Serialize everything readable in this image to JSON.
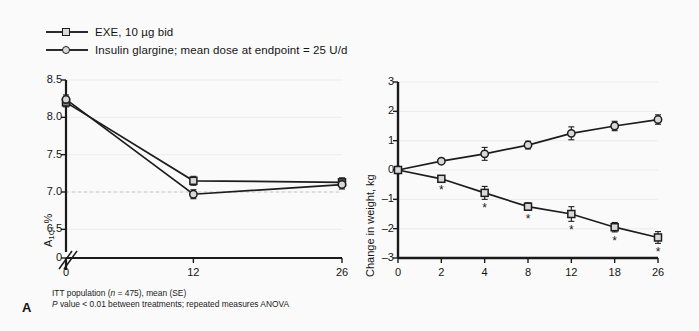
{
  "panel": {
    "label": "A"
  },
  "legend": {
    "items": [
      {
        "marker": "square-marker-icon",
        "label": "EXE, 10 µg bid"
      },
      {
        "marker": "circle-marker-icon",
        "label": "Insulin glargine; mean dose at endpoint = 25 U/d"
      }
    ]
  },
  "footnotes": [
    "ITT population (n = 475), mean (SE)",
    "P value < 0.01 between treatments; repeated measures ANOVA"
  ],
  "chart_data": [
    {
      "id": "a1c",
      "type": "line",
      "title": "",
      "xlabel": "Time, wk",
      "ylabel": "A1C, %",
      "x": [
        0,
        12,
        26
      ],
      "xticklabels": [
        "0",
        "12",
        "26"
      ],
      "yticklabels": [
        "0",
        "6.5",
        "7.0",
        "7.5",
        "8.0",
        "8.5"
      ],
      "ylim": [
        6.25,
        8.5
      ],
      "axis_break": true,
      "grid": true,
      "reference_line": 7.0,
      "legend_position": "above-figure",
      "series": [
        {
          "name": "EXE, 10 µg bid",
          "marker": "square",
          "values": [
            8.2,
            7.15,
            7.13
          ],
          "errors": [
            0.06,
            0.06,
            0.06
          ]
        },
        {
          "name": "Insulin glargine; mean dose at endpoint = 25 U/d",
          "marker": "circle",
          "values": [
            8.24,
            6.97,
            7.1
          ],
          "errors": [
            0.06,
            0.06,
            0.06
          ]
        }
      ]
    },
    {
      "id": "weight",
      "type": "line",
      "title": "",
      "xlabel": "Time, wk",
      "ylabel": "Change in weight, kg",
      "x": [
        0,
        2,
        4,
        8,
        12,
        18,
        26
      ],
      "xticklabels": [
        "0",
        "2",
        "4",
        "8",
        "12",
        "18",
        "26"
      ],
      "yticklabels": [
        "3",
        "2",
        "1",
        "0",
        "-1",
        "-2",
        "-3"
      ],
      "ylim": [
        -3,
        3
      ],
      "grid": true,
      "legend_position": "above-figure",
      "significance_marker": "*",
      "series": [
        {
          "name": "Insulin glargine; mean dose at endpoint = 25 U/d",
          "marker": "circle",
          "values": [
            0.0,
            0.3,
            0.55,
            0.85,
            1.25,
            1.5,
            1.72
          ],
          "errors": [
            0.0,
            0.08,
            0.22,
            0.13,
            0.22,
            0.16,
            0.16
          ],
          "significant": [
            false,
            false,
            false,
            false,
            false,
            false,
            false
          ]
        },
        {
          "name": "EXE, 10 µg bid",
          "marker": "square",
          "values": [
            0.0,
            -0.3,
            -0.78,
            -1.25,
            -1.5,
            -1.95,
            -2.3
          ],
          "errors": [
            0.0,
            0.08,
            0.22,
            0.13,
            0.25,
            0.16,
            0.2
          ],
          "significant": [
            false,
            true,
            true,
            true,
            true,
            true,
            true
          ]
        }
      ]
    }
  ]
}
